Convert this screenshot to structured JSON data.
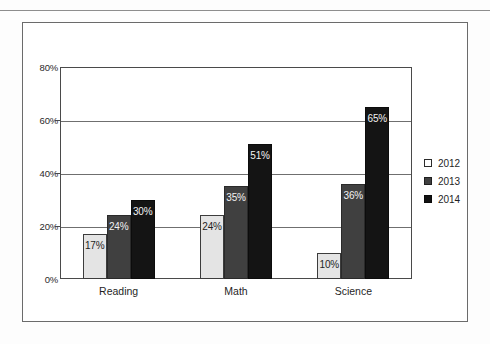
{
  "chart_data": {
    "type": "bar",
    "title": "",
    "subtitle": "",
    "xlabel": "",
    "ylabel": "",
    "categories": [
      "Reading",
      "Math",
      "Science"
    ],
    "series": [
      {
        "name": "2012",
        "color": "#e4e4e4",
        "values": [
          17,
          24,
          10
        ],
        "labels": [
          "17%",
          "24%",
          "10%"
        ]
      },
      {
        "name": "2013",
        "color": "#404040",
        "values": [
          24,
          35,
          36
        ],
        "labels": [
          "24%",
          "35%",
          "36%"
        ]
      },
      {
        "name": "2014",
        "color": "#141414",
        "values": [
          30,
          51,
          65
        ],
        "labels": [
          "30%",
          "51%",
          "65%"
        ]
      }
    ],
    "ylim": [
      0,
      80
    ],
    "ytick_values": [
      0,
      20,
      40,
      60,
      80
    ],
    "ytick_labels": [
      "0%",
      "20%",
      "40%",
      "60%",
      "80%"
    ],
    "grid": true,
    "legend_position": "right"
  },
  "legend": {
    "items": [
      {
        "label": "2012",
        "swatch": "legend-swatch-2012"
      },
      {
        "label": "2013",
        "swatch": "legend-swatch-2013"
      },
      {
        "label": "2014",
        "swatch": "legend-swatch-2014"
      }
    ]
  }
}
